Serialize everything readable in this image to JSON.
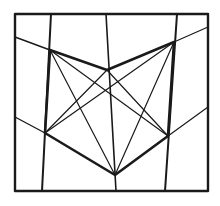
{
  "diagram": {
    "type": "geometric-line-figure",
    "background": "#ffffff",
    "stroke_color": "#1a1a1a",
    "frame": {
      "x1": 15,
      "y1": 14,
      "x2": 208,
      "y2": 191,
      "stroke_width": 2.4
    },
    "vertices": {
      "TL": [
        50,
        50
      ],
      "TM": [
        107,
        70
      ],
      "TR": [
        174,
        42
      ],
      "BL": [
        45,
        133
      ],
      "B": [
        115,
        175
      ],
      "BR": [
        168,
        136
      ]
    },
    "thick_polygon": {
      "points": "50,50 107,70 174,42 168,136 115,175 45,133 50,50",
      "stroke_width": 2.6
    },
    "verticals": [
      {
        "id": "v-left",
        "x1": 51,
        "y1": 14,
        "x2": 42,
        "y2": 191,
        "w": 2.0
      },
      {
        "id": "v-middle",
        "x1": 106,
        "y1": 14,
        "x2": 116,
        "y2": 191,
        "w": 1.6
      },
      {
        "id": "v-right",
        "x1": 177,
        "y1": 14,
        "x2": 165,
        "y2": 191,
        "w": 2.0
      }
    ],
    "thin_lines": [
      {
        "id": "ext-top-left",
        "x1": 15,
        "y1": 37,
        "x2": 50,
        "y2": 50,
        "w": 1.4
      },
      {
        "id": "ext-top-right",
        "x1": 174,
        "y1": 42,
        "x2": 208,
        "y2": 27,
        "w": 1.2
      },
      {
        "id": "ext-bottom-left",
        "x1": 15,
        "y1": 117,
        "x2": 45,
        "y2": 133,
        "w": 1.4
      },
      {
        "id": "ext-bottom-right",
        "x1": 168,
        "y1": 136,
        "x2": 208,
        "y2": 107,
        "w": 1.2
      },
      {
        "id": "diag-TL-to-B",
        "x1": 50,
        "y1": 50,
        "x2": 115,
        "y2": 175,
        "w": 1.2
      },
      {
        "id": "diag-TR-to-BL",
        "x1": 174,
        "y1": 42,
        "x2": 45,
        "y2": 133,
        "w": 1.2
      },
      {
        "id": "diag-TL-to-BR",
        "x1": 50,
        "y1": 50,
        "x2": 168,
        "y2": 136,
        "w": 1.2
      },
      {
        "id": "diag-TR-to-B",
        "x1": 174,
        "y1": 42,
        "x2": 115,
        "y2": 175,
        "w": 1.2
      },
      {
        "id": "diag-TM-to-BL",
        "x1": 107,
        "y1": 70,
        "x2": 45,
        "y2": 133,
        "w": 1.2
      },
      {
        "id": "diag-TM-to-BR",
        "x1": 107,
        "y1": 70,
        "x2": 168,
        "y2": 136,
        "w": 1.2
      }
    ]
  }
}
